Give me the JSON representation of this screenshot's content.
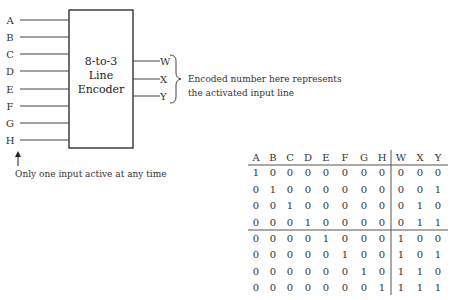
{
  "diagram": {
    "encoder_title": [
      "8-to-3",
      "Line",
      "Encoder"
    ],
    "inputs": [
      "A",
      "B",
      "C",
      "D",
      "E",
      "F",
      "G",
      "H"
    ],
    "outputs": [
      "W",
      "X",
      "Y"
    ],
    "output_annotation": [
      "Encoded number here represents",
      "the activated input line"
    ],
    "input_annotation": "Only one input active at any time"
  },
  "truth_table": {
    "input_headers": [
      "A",
      "B",
      "C",
      "D",
      "E",
      "F",
      "G",
      "H"
    ],
    "output_headers": [
      "W",
      "X",
      "Y"
    ],
    "rows": [
      {
        "inputs": [
          1,
          0,
          0,
          0,
          0,
          0,
          0,
          0
        ],
        "outputs": [
          0,
          0,
          0
        ]
      },
      {
        "inputs": [
          0,
          1,
          0,
          0,
          0,
          0,
          0,
          0
        ],
        "outputs": [
          0,
          0,
          1
        ]
      },
      {
        "inputs": [
          0,
          0,
          1,
          0,
          0,
          0,
          0,
          0
        ],
        "outputs": [
          0,
          1,
          0
        ]
      },
      {
        "inputs": [
          0,
          0,
          0,
          1,
          0,
          0,
          0,
          0
        ],
        "outputs": [
          0,
          1,
          1
        ]
      },
      {
        "inputs": [
          0,
          0,
          0,
          0,
          1,
          0,
          0,
          0
        ],
        "outputs": [
          1,
          0,
          0
        ]
      },
      {
        "inputs": [
          0,
          0,
          0,
          0,
          0,
          1,
          0,
          0
        ],
        "outputs": [
          1,
          0,
          1
        ]
      },
      {
        "inputs": [
          0,
          0,
          0,
          0,
          0,
          0,
          1,
          0
        ],
        "outputs": [
          1,
          1,
          0
        ]
      },
      {
        "inputs": [
          0,
          0,
          0,
          0,
          0,
          0,
          0,
          1
        ],
        "outputs": [
          1,
          1,
          1
        ]
      }
    ]
  }
}
